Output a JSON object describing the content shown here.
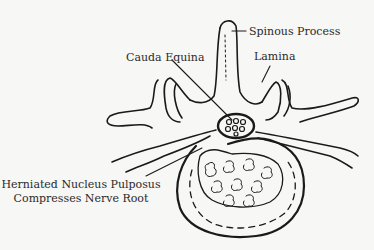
{
  "diagram": {
    "type": "anatomical-illustration",
    "labels": [
      {
        "id": "spinous_process",
        "text": "Spinous Process"
      },
      {
        "id": "lamina",
        "text": "Lamina"
      },
      {
        "id": "cauda_equina",
        "text": "Cauda Equina"
      },
      {
        "id": "herniated_line1",
        "text": "Herniated Nucleus Pulposus"
      },
      {
        "id": "herniated_line2",
        "text": "Compresses Nerve Root"
      }
    ],
    "colors": {
      "background": "#f7f7f5",
      "ink": "#1a1a1a",
      "text": "#2a2a2a"
    }
  }
}
